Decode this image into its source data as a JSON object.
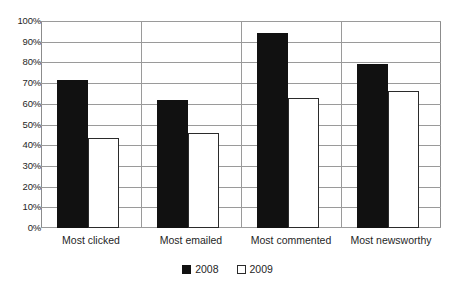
{
  "chart_data": {
    "type": "bar",
    "title": "",
    "subtitle": "",
    "xlabel": "",
    "ylabel": "",
    "ylim": [
      0,
      100
    ],
    "ytick_labels": [
      "0%",
      "10%",
      "20%",
      "30%",
      "40%",
      "50%",
      "60%",
      "70%",
      "80%",
      "90%",
      "100%"
    ],
    "ytick_values": [
      0,
      10,
      20,
      30,
      40,
      50,
      60,
      70,
      80,
      90,
      100
    ],
    "grid": "horizontal",
    "legend_position": "bottom-center",
    "categories": [
      "Most clicked",
      "Most emailed",
      "Most commented",
      "Most newsworthy"
    ],
    "series": [
      {
        "name": "2008",
        "color": "#111111",
        "values": [
          71.5,
          62,
          94,
          79
        ]
      },
      {
        "name": "2009",
        "color": "#ffffff",
        "values": [
          43.5,
          46,
          63,
          66
        ]
      }
    ]
  },
  "legend": {
    "items": [
      {
        "label": "2008",
        "swatch": "filled-black-square"
      },
      {
        "label": "2009",
        "swatch": "outlined-white-square"
      }
    ]
  },
  "colors": {
    "series_2008": "#111111",
    "series_2009": "#ffffff",
    "series_2009_border": "#2b2b2b",
    "gridline": "#9a9a9a",
    "axis": "#8c8c8c",
    "text": "#1f1f1f",
    "background": "#ffffff"
  }
}
